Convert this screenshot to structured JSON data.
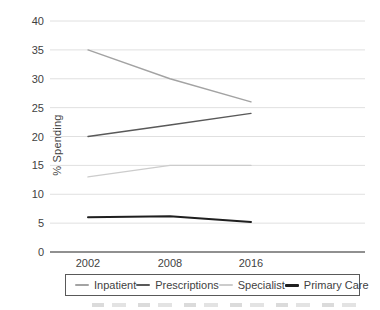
{
  "chart_data": {
    "type": "line",
    "categories": [
      "2002",
      "2008",
      "2016"
    ],
    "series": [
      {
        "name": "Inpatient",
        "values": [
          35,
          30,
          26
        ],
        "color": "#a3a3a3",
        "stroke_width": 1.4
      },
      {
        "name": "Prescriptions",
        "values": [
          20,
          22,
          24
        ],
        "color": "#595959",
        "stroke_width": 1.4
      },
      {
        "name": "Specialist",
        "values": [
          13,
          15,
          15
        ],
        "color": "#cccccc",
        "stroke_width": 1.4
      },
      {
        "name": "Primary Care",
        "values": [
          6,
          6.2,
          5.2
        ],
        "color": "#1f1f1f",
        "stroke_width": 2
      }
    ],
    "title": "",
    "xlabel": "",
    "ylabel": "% Spending",
    "ylim": [
      0,
      40
    ],
    "yticks": [
      0,
      5,
      10,
      15,
      20,
      25,
      30,
      35,
      40
    ],
    "grid": true,
    "legend_position": "bottom"
  },
  "colors": {
    "gridline": "#e0e0e0",
    "axis_line": "#6b6b6b",
    "text": "#3f3f3f",
    "legend_border": "#595959",
    "background": "#ffffff"
  }
}
